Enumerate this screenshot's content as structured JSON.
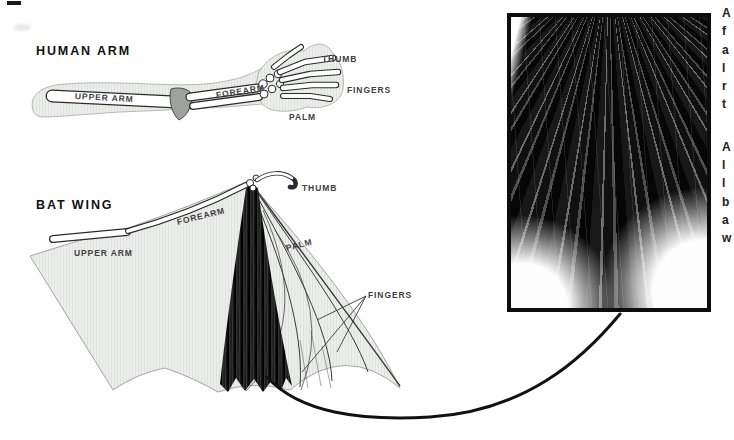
{
  "human_arm_diagram": {
    "title": "HUMAN ARM",
    "labels": {
      "upper_arm": "UPPER ARM",
      "forearm": "FOREARM",
      "thumb": "THUMB",
      "fingers": "FINGERS",
      "palm": "PALM"
    }
  },
  "bat_wing_diagram": {
    "title": "BAT WING",
    "labels": {
      "upper_arm": "UPPER ARM",
      "forearm": "FOREARM",
      "thumb": "THUMB",
      "palm": "PALM",
      "fingers": "FINGERS"
    }
  },
  "inset_photo": {
    "semantic": "bat-wing-membrane-closeup-photo"
  },
  "right_column_text": {
    "para1_line_starts": [
      "A",
      "f",
      "a",
      "l",
      "r",
      "t"
    ],
    "para2_line_starts": [
      "A",
      "l",
      "l",
      "b",
      "a",
      "w"
    ]
  },
  "colors": {
    "membrane_gray": "#ebedeb",
    "stripe_gray": "#e0e2e0",
    "joint_gray": "#9fa19f",
    "bone_outline": "#2b2b2b",
    "label_text": "#3f3f3f",
    "title_text": "#111111",
    "connector_black": "#111111",
    "inset_border": "#0d0d0d"
  }
}
